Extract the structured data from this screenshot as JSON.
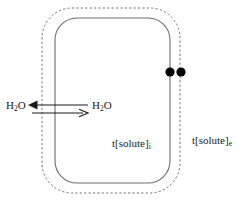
{
  "figure": {
    "colors": {
      "membrane_solid": "#6b6b6b",
      "membrane_dashed": "#707070",
      "arrow": "#1a1a1a",
      "dot": "#000000",
      "text": "#1a1a1a",
      "background": "#ffffff"
    },
    "inner_boundary": {
      "name": "cell-membrane-solid",
      "shape": "rounded-rectangle",
      "style": "solid",
      "x": 55,
      "y": 18,
      "width": 115,
      "height": 165,
      "radius": 22
    },
    "outer_boundary": {
      "name": "external-boundary-dashed",
      "shape": "rounded-rectangle",
      "style": "dashed",
      "x": 42,
      "y": 8,
      "width": 138,
      "height": 185,
      "radius": 30
    },
    "markers": [
      {
        "name": "solute-dot-inner",
        "cx": 170,
        "cy": 72,
        "r": 4.5
      },
      {
        "name": "solute-dot-outer",
        "cx": 181,
        "cy": 72,
        "r": 4.5
      }
    ],
    "arrows": {
      "name": "water-flux-double-arrow",
      "outward": {
        "direction": "left",
        "head": "filled",
        "y": 105,
        "x_from": 88,
        "x_to": 28
      },
      "inward": {
        "direction": "right",
        "head": "open",
        "y": 113,
        "x_from": 32,
        "x_to": 88
      }
    },
    "labels": {
      "water_external": {
        "formula": "H",
        "sub": "2",
        "formula_tail": "O"
      },
      "water_internal": {
        "formula": "H",
        "sub": "2",
        "formula_tail": "O"
      },
      "solute_internal": {
        "text": "t[solute]",
        "sub": "i"
      },
      "solute_external": {
        "text": "t[solute]",
        "sub": "e"
      }
    }
  }
}
